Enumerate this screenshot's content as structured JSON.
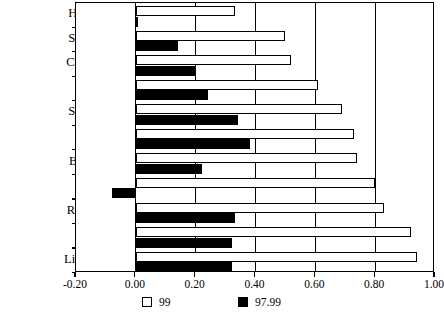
{
  "chart_data": {
    "type": "bar",
    "orientation": "horizontal",
    "title": "",
    "xlabel": "",
    "ylabel": "",
    "xlim": [
      -0.2,
      1.0
    ],
    "xticks": [
      "-0.20",
      "0.00",
      "0.20",
      "0.40",
      "0.60",
      "0.80",
      "1.00"
    ],
    "xtick_values": [
      -0.2,
      0.0,
      0.2,
      0.4,
      0.6,
      0.8,
      1.0
    ],
    "grid": true,
    "grid_axis": "x",
    "legend_position": "bottom",
    "categories": [
      "Hungary",
      "Slovakia",
      "Czech R.",
      "CEE",
      "Slovenia",
      "Poland",
      "Bulgaria",
      "Latvia",
      "Romania",
      "Estonia",
      "Lithuania"
    ],
    "series": [
      {
        "name": "99",
        "color": "#ffffff",
        "edge_color": "#000000",
        "values": [
          0.33,
          0.5,
          0.52,
          0.61,
          0.69,
          0.73,
          0.74,
          0.8,
          0.83,
          0.92,
          0.94
        ]
      },
      {
        "name": "97.99",
        "color": "#000000",
        "edge_color": "#000000",
        "values": [
          0.0,
          0.14,
          0.2,
          0.24,
          0.34,
          0.38,
          0.22,
          -0.08,
          0.33,
          0.32,
          0.32
        ]
      }
    ]
  },
  "legend": {
    "entries": [
      {
        "label": "99",
        "swatch": "white"
      },
      {
        "label": "97.99",
        "swatch": "black"
      }
    ]
  }
}
